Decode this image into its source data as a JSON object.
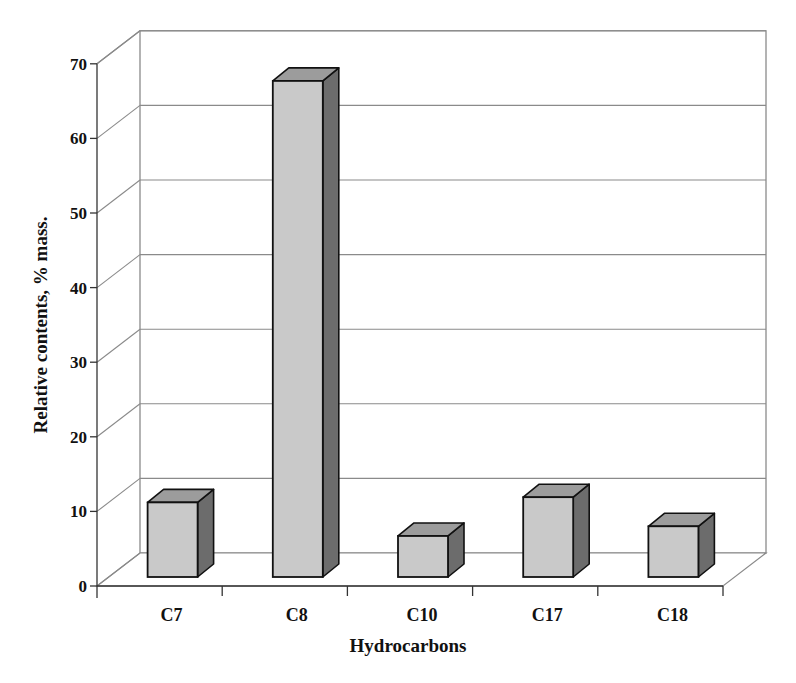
{
  "chart_data": {
    "type": "bar",
    "style": "3d-column",
    "title": "",
    "xlabel": "Hydrocarbons",
    "ylabel": "Relative contents, % mass.",
    "categories": [
      "C7",
      "C8",
      "C10",
      "C17",
      "C18"
    ],
    "values": [
      10,
      66.5,
      5.5,
      10.7,
      6.8
    ],
    "ylim": [
      0,
      70
    ],
    "yticks": [
      0,
      10,
      20,
      30,
      40,
      50,
      60,
      70
    ],
    "grid": true,
    "legend": null,
    "colors": {
      "front": "#c9c9c9",
      "top": "#9c9c9c",
      "side": "#6c6c6c",
      "outline": "#111111",
      "grid": "#8a8a8a"
    }
  }
}
